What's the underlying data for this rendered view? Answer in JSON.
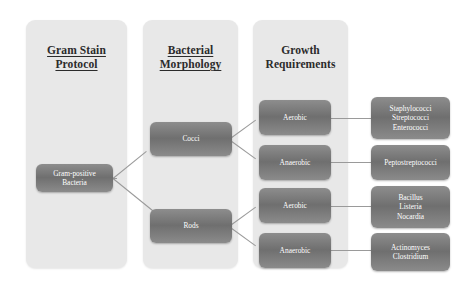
{
  "diagram": {
    "columns": [
      {
        "heading_line1": "Gram Stain",
        "heading_line2": "Protocol",
        "underlined": true
      },
      {
        "heading_line1": "Bacterial",
        "heading_line2": "Morphology",
        "underlined": true
      },
      {
        "heading_line1": "Growth",
        "heading_line2": "Requirements",
        "underlined": false
      }
    ],
    "nodes": {
      "root": {
        "line1": "Gram-positive",
        "line2": "Bacteria"
      },
      "morphology": [
        {
          "label": "Cocci"
        },
        {
          "label": "Rods"
        }
      ],
      "growth": [
        {
          "label": "Aerobic"
        },
        {
          "label": "Anaerobic"
        },
        {
          "label": "Aerobic"
        },
        {
          "label": "Anaerobic"
        }
      ],
      "organisms": [
        {
          "line1": "Staphylococci",
          "line2": "Streptococci",
          "line3": "Enterococci"
        },
        {
          "line1": "Peptostreptococci",
          "line2": "",
          "line3": ""
        },
        {
          "line1": "Bacillus",
          "line2": "Listeria",
          "line3": "Nocardia"
        },
        {
          "line1": "Actinomyces",
          "line2": "Clostridium",
          "line3": ""
        }
      ]
    },
    "colors": {
      "panel": "#e8e8e8",
      "node_top": "#8d8d8d",
      "node_mid": "#6f6f6f",
      "node_text": "#ffffff",
      "connector": "#9a9a9a",
      "background": "#ffffff",
      "heading_text": "#2b2b2b"
    }
  }
}
